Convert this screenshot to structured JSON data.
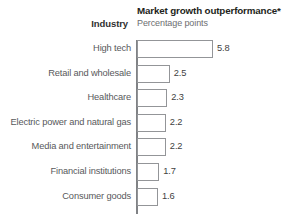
{
  "header": {
    "industry_label": "Industry",
    "title": "Market growth outperformance*",
    "subtitle": "Percentage points"
  },
  "colors": {
    "bar_fill": "#ffffff",
    "bar_stroke": "#939598",
    "axis": "#808285",
    "label_text": "#58595b",
    "title_text": "#231f20",
    "subtitle_text": "#6d6e71",
    "background": "#ffffff"
  },
  "chart_data": {
    "type": "bar",
    "orientation": "horizontal",
    "title": "Market growth outperformance*",
    "subtitle": "Percentage points",
    "xlabel": "Percentage points",
    "ylabel": "Industry",
    "grid": false,
    "legend": false,
    "xlim": [
      0,
      5.8
    ],
    "categories": [
      "High tech",
      "Retail and wholesale",
      "Healthcare",
      "Electric power and natural gas",
      "Media and entertainment",
      "Financial institutions",
      "Consumer goods"
    ],
    "values": [
      5.8,
      2.5,
      2.3,
      2.2,
      2.2,
      1.7,
      1.6
    ],
    "value_labels": [
      "5.8",
      "2.5",
      "2.3",
      "2.2",
      "2.2",
      "1.7",
      "1.6"
    ]
  }
}
